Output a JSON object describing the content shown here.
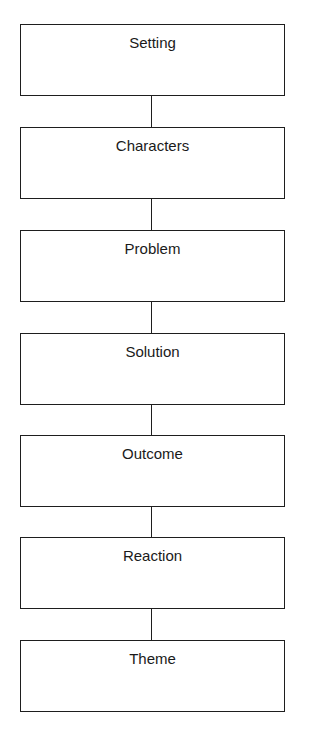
{
  "diagram": {
    "type": "vertical-flowchart",
    "nodes": [
      {
        "label": "Setting"
      },
      {
        "label": "Characters"
      },
      {
        "label": "Problem"
      },
      {
        "label": "Solution"
      },
      {
        "label": "Outcome"
      },
      {
        "label": "Reaction"
      },
      {
        "label": "Theme"
      }
    ],
    "edges": [
      [
        "Setting",
        "Characters"
      ],
      [
        "Characters",
        "Problem"
      ],
      [
        "Problem",
        "Solution"
      ],
      [
        "Solution",
        "Outcome"
      ],
      [
        "Outcome",
        "Reaction"
      ],
      [
        "Reaction",
        "Theme"
      ]
    ]
  }
}
